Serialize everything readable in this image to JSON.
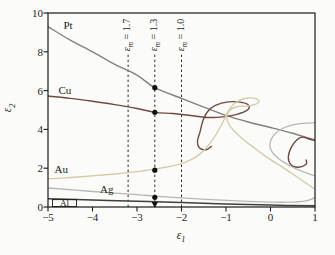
{
  "figure": {
    "background": "#fbfbf9",
    "axis_color": "#1b1b1b",
    "text_color": "#1b1b1b"
  },
  "axes": {
    "x": {
      "symbol": "ε",
      "sub": "1",
      "ticks": [
        -5,
        -4,
        -3,
        -2,
        -1,
        0,
        1
      ]
    },
    "y": {
      "symbol": "ε",
      "sub": "2",
      "ticks": [
        0,
        2,
        4,
        6,
        8,
        10
      ]
    }
  },
  "chart_data": {
    "type": "line",
    "xlabel": "ε1",
    "ylabel": "ε2",
    "xlim": [
      -5,
      1
    ],
    "ylim": [
      0,
      10
    ],
    "grid": false,
    "legend": "curve labels inline",
    "series": [
      {
        "name": "Pt",
        "color": "#85807c",
        "width": 1.4,
        "label_pos": [
          -4.55,
          9.4
        ],
        "segments": [
          [
            [
              -5,
              9.3
            ],
            [
              -4.5,
              8.6
            ],
            [
              -4,
              8.0
            ],
            [
              -3.5,
              7.35
            ],
            [
              -3,
              6.8
            ],
            [
              -2.6,
              6.15
            ],
            [
              -2,
              5.6
            ],
            [
              -1.5,
              5.15
            ],
            [
              -1,
              4.72
            ],
            [
              -0.5,
              4.38
            ],
            [
              0,
              4.1
            ],
            [
              0.5,
              3.8
            ],
            [
              1,
              3.45
            ]
          ]
        ]
      },
      {
        "name": "Cu",
        "color": "#6f4a43",
        "width": 1.4,
        "label_pos": [
          -4.62,
          6.05
        ],
        "segments": [
          [
            [
              -5,
              5.72
            ],
            [
              -4.5,
              5.6
            ],
            [
              -4,
              5.45
            ],
            [
              -3.5,
              5.28
            ],
            [
              -3,
              5.08
            ],
            [
              -2.6,
              4.88
            ],
            [
              -2.2,
              4.82
            ],
            [
              -1.8,
              4.72
            ],
            [
              -1.5,
              4.63
            ],
            [
              -1.2,
              4.62
            ],
            [
              -0.85,
              4.72
            ],
            [
              -0.55,
              4.95
            ],
            [
              -0.48,
              5.2
            ],
            [
              -0.62,
              5.38
            ],
            [
              -0.95,
              5.42
            ],
            [
              -1.25,
              5.22
            ],
            [
              -1.42,
              4.9
            ],
            [
              -1.52,
              4.45
            ],
            [
              -1.58,
              3.9
            ],
            [
              -1.64,
              3.4
            ],
            [
              -1.6,
              3.05
            ],
            [
              -1.45,
              2.95
            ],
            [
              -1.33,
              3.12
            ]
          ],
          [
            [
              1,
              3.42
            ],
            [
              0.85,
              3.52
            ],
            [
              0.72,
              3.6
            ],
            [
              0.6,
              3.48
            ],
            [
              0.46,
              3.05
            ],
            [
              0.4,
              2.55
            ],
            [
              0.47,
              2.15
            ],
            [
              0.63,
              2.05
            ],
            [
              0.8,
              2.2
            ],
            [
              0.8,
              2.42
            ]
          ]
        ]
      },
      {
        "name": "Au",
        "color": "#d3c9a5",
        "width": 1.3,
        "label_pos": [
          -4.7,
          1.98
        ],
        "segments": [
          [
            [
              -5,
              1.45
            ],
            [
              -4.5,
              1.52
            ],
            [
              -4,
              1.6
            ],
            [
              -3.5,
              1.7
            ],
            [
              -3,
              1.82
            ],
            [
              -2.6,
              1.95
            ],
            [
              -2.2,
              2.12
            ],
            [
              -1.9,
              2.32
            ],
            [
              -1.6,
              2.7
            ],
            [
              -1.35,
              3.3
            ],
            [
              -1.12,
              4.15
            ],
            [
              -0.97,
              4.85
            ],
            [
              -0.83,
              5.3
            ],
            [
              -0.6,
              5.58
            ],
            [
              -0.35,
              5.6
            ],
            [
              -0.26,
              5.42
            ],
            [
              -0.45,
              5.22
            ],
            [
              -0.75,
              5.18
            ],
            [
              -0.93,
              4.95
            ],
            [
              -0.98,
              4.55
            ],
            [
              -0.87,
              4.05
            ],
            [
              -0.63,
              3.52
            ],
            [
              -0.35,
              3.02
            ],
            [
              -0.05,
              2.52
            ],
            [
              0.25,
              2.08
            ],
            [
              0.55,
              1.62
            ],
            [
              0.85,
              1.15
            ],
            [
              1,
              0.92
            ]
          ]
        ]
      },
      {
        "name": "Ag",
        "color": "#b7b7b2",
        "width": 1.3,
        "label_pos": [
          -3.68,
          0.95
        ],
        "segments": [
          [
            [
              -5,
              0.98
            ],
            [
              -4,
              0.8
            ],
            [
              -3,
              0.64
            ],
            [
              -2.6,
              0.56
            ],
            [
              -2,
              0.47
            ],
            [
              -1,
              0.34
            ],
            [
              -0.2,
              0.26
            ],
            [
              0.4,
              0.25
            ],
            [
              0.8,
              0.32
            ],
            [
              1,
              0.48
            ]
          ],
          [
            [
              1,
              4.35
            ],
            [
              0.62,
              4.28
            ],
            [
              0.25,
              4.02
            ],
            [
              0.03,
              3.55
            ],
            [
              0.0,
              3.0
            ],
            [
              0.18,
              2.5
            ],
            [
              0.5,
              2.05
            ],
            [
              0.85,
              1.72
            ],
            [
              1,
              1.62
            ]
          ]
        ]
      },
      {
        "name": "Al",
        "color": "#433f3c",
        "width": 1.5,
        "label_pos": [
          -4.63,
          0.2
        ],
        "label_size": 9,
        "label_box": {
          "x1": -4.9,
          "y1": 0.02,
          "x2": -4.36,
          "y2": 0.38
        },
        "segments": [
          [
            [
              -5,
              0.42
            ],
            [
              -4,
              0.36
            ],
            [
              -3,
              0.3
            ],
            [
              -2.6,
              0.27
            ],
            [
              -2,
              0.23
            ],
            [
              -1,
              0.16
            ],
            [
              0,
              0.1
            ],
            [
              1,
              0.06
            ]
          ]
        ]
      }
    ],
    "reference_lines": [
      {
        "x": -3.2,
        "y_top": 7.85,
        "label_symbol": "ε",
        "label_sub": "m",
        "label_value": "= 1.7"
      },
      {
        "x": -2.6,
        "y_top": 7.85,
        "label_symbol": "ε",
        "label_sub": "m",
        "label_value": "= 1.3"
      },
      {
        "x": -2.0,
        "y_top": 7.85,
        "label_symbol": "ε",
        "label_sub": "m",
        "label_value": "= 1.0"
      }
    ],
    "markers": [
      {
        "x": -2.6,
        "y": 6.15,
        "shape": "circle"
      },
      {
        "x": -2.6,
        "y": 4.88,
        "shape": "circle"
      },
      {
        "x": -2.6,
        "y": 1.9,
        "shape": "circle"
      },
      {
        "x": -2.6,
        "y": 0.5,
        "shape": "circle"
      },
      {
        "x": -2.6,
        "y": 0.13,
        "shape": "triangle-down"
      }
    ],
    "marker_color": "#111111",
    "reference_line_color": "#2b2b2b"
  }
}
